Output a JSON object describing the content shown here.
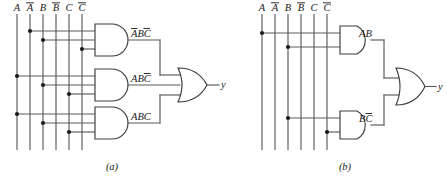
{
  "figure": {
    "type": "logic-circuit-diagram",
    "background_color": "#ffffff",
    "line_color": "#5a5a5a",
    "gate_outline_color": "#3c3c3c",
    "text_color": "#1a1a1a",
    "panels": [
      {
        "id": "a",
        "caption": "(a)",
        "inputs": [
          "A",
          "A̅",
          "B",
          "B̅",
          "C",
          "C̅"
        ],
        "input_labels_plain": [
          "A",
          "A",
          "B",
          "B",
          "C",
          "C"
        ],
        "input_overbar": [
          false,
          true,
          false,
          true,
          false,
          true
        ],
        "and_gates": [
          {
            "label_plain": "ABC",
            "label_overbar": [
              true,
              false,
              true
            ],
            "inputs": [
              "A̅",
              "B",
              "C̅"
            ]
          },
          {
            "label_plain": "ABC",
            "label_overbar": [
              false,
              false,
              true
            ],
            "inputs": [
              "A",
              "B",
              "C̅"
            ]
          },
          {
            "label_plain": "ABC",
            "label_overbar": [
              false,
              false,
              false
            ],
            "inputs": [
              "A",
              "B",
              "C"
            ]
          }
        ],
        "or_gate": {
          "inputs": 3
        },
        "output": "y"
      },
      {
        "id": "b",
        "caption": "(b)",
        "inputs": [
          "A",
          "A̅",
          "B",
          "B̅",
          "C",
          "C̅"
        ],
        "input_labels_plain": [
          "A",
          "A",
          "B",
          "B",
          "C",
          "C"
        ],
        "input_overbar": [
          false,
          true,
          false,
          true,
          false,
          true
        ],
        "and_gates": [
          {
            "label_plain": "AB",
            "label_overbar": [
              false,
              false
            ],
            "inputs": [
              "A",
              "B"
            ]
          },
          {
            "label_plain": "BC",
            "label_overbar": [
              false,
              true
            ],
            "inputs": [
              "B",
              "C̅"
            ]
          }
        ],
        "or_gate": {
          "inputs": 2
        },
        "output": "y"
      }
    ]
  },
  "panel_a": {
    "inputs": {
      "i1": "A",
      "i2": "A",
      "i3": "B",
      "i4": "B",
      "i5": "C",
      "i6": "C"
    },
    "gate1": {
      "t1": "A",
      "t2": "B",
      "t3": "C"
    },
    "gate2": {
      "t1": "A",
      "t2": "B",
      "t3": "C"
    },
    "gate3": {
      "t1": "A",
      "t2": "B",
      "t3": "C"
    },
    "output": "y",
    "caption": "(a)"
  },
  "panel_b": {
    "inputs": {
      "i1": "A",
      "i2": "A",
      "i3": "B",
      "i4": "B",
      "i5": "C",
      "i6": "C"
    },
    "gate1": {
      "t1": "A",
      "t2": "B"
    },
    "gate2": {
      "t1": "B",
      "t2": "C"
    },
    "output": "y",
    "caption": "(b)"
  }
}
